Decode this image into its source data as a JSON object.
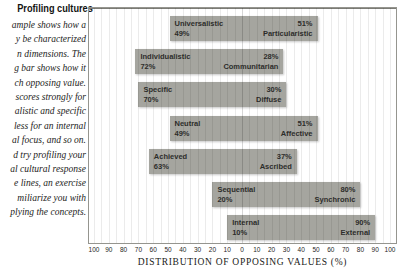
{
  "sidebar": {
    "heading": "Profiling cultures",
    "lines": [
      "ample shows how a",
      "y be characterized",
      "n dimensions. The",
      "g bar shows how it",
      "ch opposing value.",
      "scores strongly for",
      "alistic and specific",
      "less for an internal",
      "al focus, and so on.",
      "d try profiling your",
      "al cultural response",
      "e lines, an exercise",
      "miliarize you with",
      "plying the concepts."
    ]
  },
  "chart_data": {
    "type": "bar",
    "variant": "diverging-paired-horizontal",
    "title": "",
    "axis": {
      "label": "DISTRIBUTION OF OPPOSING VALUES (%)",
      "ticks": [
        100,
        90,
        80,
        70,
        60,
        50,
        40,
        30,
        20,
        10,
        0,
        10,
        20,
        30,
        40,
        50,
        60,
        70,
        80,
        90,
        100
      ],
      "tick_step": 10,
      "max_each_side": 100,
      "gridline_step": 5,
      "grid": true
    },
    "pairs": [
      {
        "left_label": "Universalistic",
        "left_value": 49,
        "right_label": "Particularistic",
        "right_value": 51
      },
      {
        "left_label": "Individualistic",
        "left_value": 72,
        "right_label": "Communitarian",
        "right_value": 28
      },
      {
        "left_label": "Specific",
        "left_value": 70,
        "right_label": "Diffuse",
        "right_value": 30
      },
      {
        "left_label": "Neutral",
        "left_value": 49,
        "right_label": "Affective",
        "right_value": 51
      },
      {
        "left_label": "Achieved",
        "left_value": 63,
        "right_label": "Ascribed",
        "right_value": 37
      },
      {
        "left_label": "Sequential",
        "left_value": 20,
        "right_label": "Synchronic",
        "right_value": 80
      },
      {
        "left_label": "Internal",
        "left_value": 10,
        "right_label": "External",
        "right_value": 90
      }
    ]
  },
  "colors": {
    "bar": "#a5a59f",
    "bar_text": "#2d2d2b",
    "plot_border": "#95958f",
    "plot_bg_left": "#fbfbf9",
    "plot_bg_right": "#c9c9c5",
    "gridline": "#00000014",
    "center_line": "#00000029",
    "text": "#1d1d1b"
  }
}
